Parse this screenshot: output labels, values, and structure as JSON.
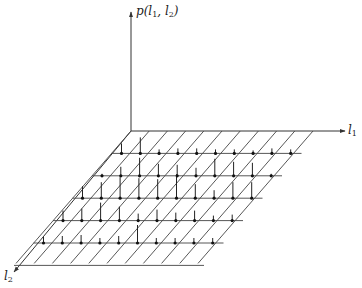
{
  "figure": {
    "type": "3d-probability-mass-plot",
    "axes": {
      "vertical": {
        "label": "p(l",
        "sub1": "1",
        "mid": ", l",
        "sub2": "2",
        "end": ")"
      },
      "x_axis": {
        "label": "l",
        "sub": "1"
      },
      "y_axis": {
        "label": "l",
        "sub": "2"
      }
    },
    "grid": {
      "columns": 10,
      "rows": 5
    },
    "colors": {
      "ink": "#333333",
      "background": "#ffffff"
    }
  },
  "chart_data": {
    "type": "3d-stem",
    "title": "",
    "xlabel": "l1",
    "ylabel": "l2",
    "zlabel": "p(l1, l2)",
    "grid": {
      "l1_points": 10,
      "l2_points": 5
    },
    "rows": [
      {
        "l2": 1,
        "heights": [
          0,
          0,
          0,
          0,
          0,
          0,
          0,
          0,
          0,
          0
        ]
      },
      {
        "l2": 2,
        "heights": [
          10,
          16,
          4,
          5,
          5,
          4,
          4,
          3,
          5,
          4
        ]
      },
      {
        "l2": 3,
        "heights": [
          2,
          9,
          18,
          12,
          11,
          8,
          17,
          14,
          13,
          2
        ]
      },
      {
        "l2": 4,
        "heights": [
          12,
          16,
          21,
          20,
          19,
          24,
          14,
          8,
          16,
          16
        ]
      },
      {
        "l2": 5,
        "heights": [
          10,
          12,
          18,
          14,
          7,
          11,
          8,
          10,
          5,
          6
        ]
      },
      {
        "l2": 6,
        "heights": [
          6,
          7,
          8,
          5,
          7,
          18,
          5,
          5,
          5,
          5
        ]
      }
    ]
  }
}
